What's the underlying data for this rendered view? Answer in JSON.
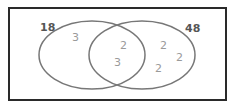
{
  "diagram": {
    "type": "venn",
    "sets": [
      {
        "id": "A",
        "label": "18"
      },
      {
        "id": "B",
        "label": "48"
      }
    ],
    "regions": {
      "only_a": [
        "3"
      ],
      "intersection": [
        "2",
        "3"
      ],
      "only_b": [
        "2",
        "2",
        "2"
      ]
    },
    "colors": {
      "frame": "#2a2a2a",
      "ellipse_stroke": "#777777",
      "set_label": "#555555",
      "region_text": "#9a9a9a"
    }
  }
}
